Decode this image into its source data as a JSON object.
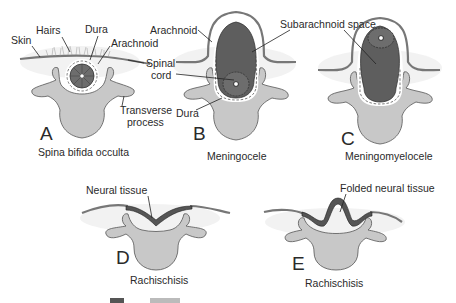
{
  "panels": [
    {
      "letter": "A",
      "caption": "Spina bifida occulta",
      "labels": {
        "skin": "Skin",
        "hairs": "Hairs",
        "dura": "Dura",
        "arachnoid": "Arachnoid",
        "transverse": "Transverse",
        "process": "process"
      }
    },
    {
      "letter": "B",
      "caption": "Meningocele",
      "labels": {
        "arachnoid": "Arachnoid",
        "spinal": "Spinal",
        "cord": "cord",
        "dura": "Dura"
      }
    },
    {
      "letter": "C",
      "caption": "Meningomyelocele",
      "labels": {
        "subarachnoid": "Subarachnoid space"
      }
    },
    {
      "letter": "D",
      "caption": "Rachischisis",
      "labels": {
        "neural": "Neural tissue"
      }
    },
    {
      "letter": "E",
      "caption": "Rachischisis",
      "labels": {
        "folded": "Folded neural tissue"
      }
    }
  ],
  "colors": {
    "bone": "#c8c8c8",
    "cord": "#6d6d6d",
    "sac": "#5e5e5e",
    "skin": "#777777"
  }
}
